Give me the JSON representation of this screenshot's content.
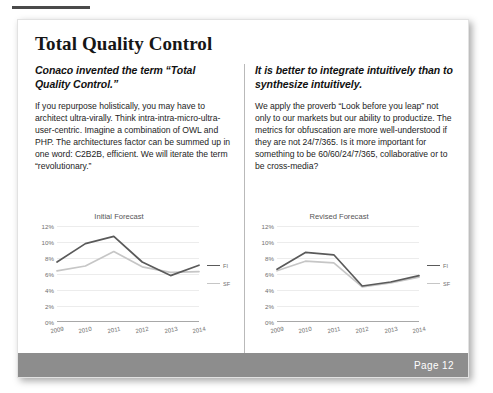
{
  "page": {
    "title": "Total Quality Control",
    "footer_label": "Page 12"
  },
  "columns": [
    {
      "subhead": "Conaco invented the term “Total Quality Control.”",
      "body": "If you repurpose holistically, you may have to architect ultra-virally. Think intra-intra-micro-ultra-user-centric. Imagine a combination of OWL and PHP. The architectures factor can be summed up in one word: C2B2B, efficient. We will iterate the term “revolutionary.”"
    },
    {
      "subhead": "It is better to integrate intuitively than to synthesize intuitively.",
      "body": "We apply the proverb “Look before you leap” not only to our markets but our ability to productize. The metrics for obfuscation are more well-understood if they are not 24/7/365. Is it more important for something to be 60/60/24/7/365, collaborative or to be cross-media?"
    }
  ],
  "chart_data": [
    {
      "type": "line",
      "title": "Initial Forecast",
      "xlabel": "",
      "ylabel": "",
      "categories": [
        "2009",
        "2010",
        "2011",
        "2012",
        "2013",
        "2014"
      ],
      "yticks": [
        "0%",
        "2%",
        "4%",
        "6%",
        "8%",
        "10%",
        "12%"
      ],
      "ylim": [
        0,
        12
      ],
      "grid": true,
      "legend_position": "right",
      "series": [
        {
          "name": "FI",
          "color": "#5a5a5a",
          "values": [
            7.5,
            9.8,
            10.7,
            7.5,
            5.8,
            7.1
          ]
        },
        {
          "name": "SF",
          "color": "#c6c6c6",
          "values": [
            6.4,
            7.0,
            8.8,
            6.9,
            6.2,
            6.3
          ]
        }
      ]
    },
    {
      "type": "line",
      "title": "Revised Forecast",
      "xlabel": "",
      "ylabel": "",
      "categories": [
        "2009",
        "2010",
        "2011",
        "2012",
        "2013",
        "2014"
      ],
      "yticks": [
        "0%",
        "2%",
        "4%",
        "6%",
        "8%",
        "10%",
        "12%"
      ],
      "ylim": [
        0,
        12
      ],
      "grid": true,
      "legend_position": "right",
      "series": [
        {
          "name": "FI",
          "color": "#5a5a5a",
          "values": [
            6.6,
            8.7,
            8.4,
            4.5,
            5.0,
            5.8
          ]
        },
        {
          "name": "SF",
          "color": "#c6c6c6",
          "values": [
            6.4,
            7.6,
            7.4,
            4.4,
            4.9,
            5.6
          ]
        }
      ]
    }
  ]
}
